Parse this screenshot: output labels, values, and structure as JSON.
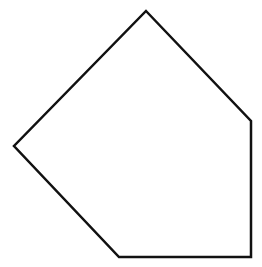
{
  "diagram": {
    "type": "polygon",
    "shape": "pentagon",
    "background": "#ffffff",
    "stroke_color": "#111111",
    "fill_color": "#ffffff",
    "stroke_width": 2.5,
    "vertices": [
      {
        "x": 146,
        "y": 11
      },
      {
        "x": 251,
        "y": 121
      },
      {
        "x": 251,
        "y": 257
      },
      {
        "x": 119,
        "y": 257
      },
      {
        "x": 14,
        "y": 146
      }
    ]
  }
}
